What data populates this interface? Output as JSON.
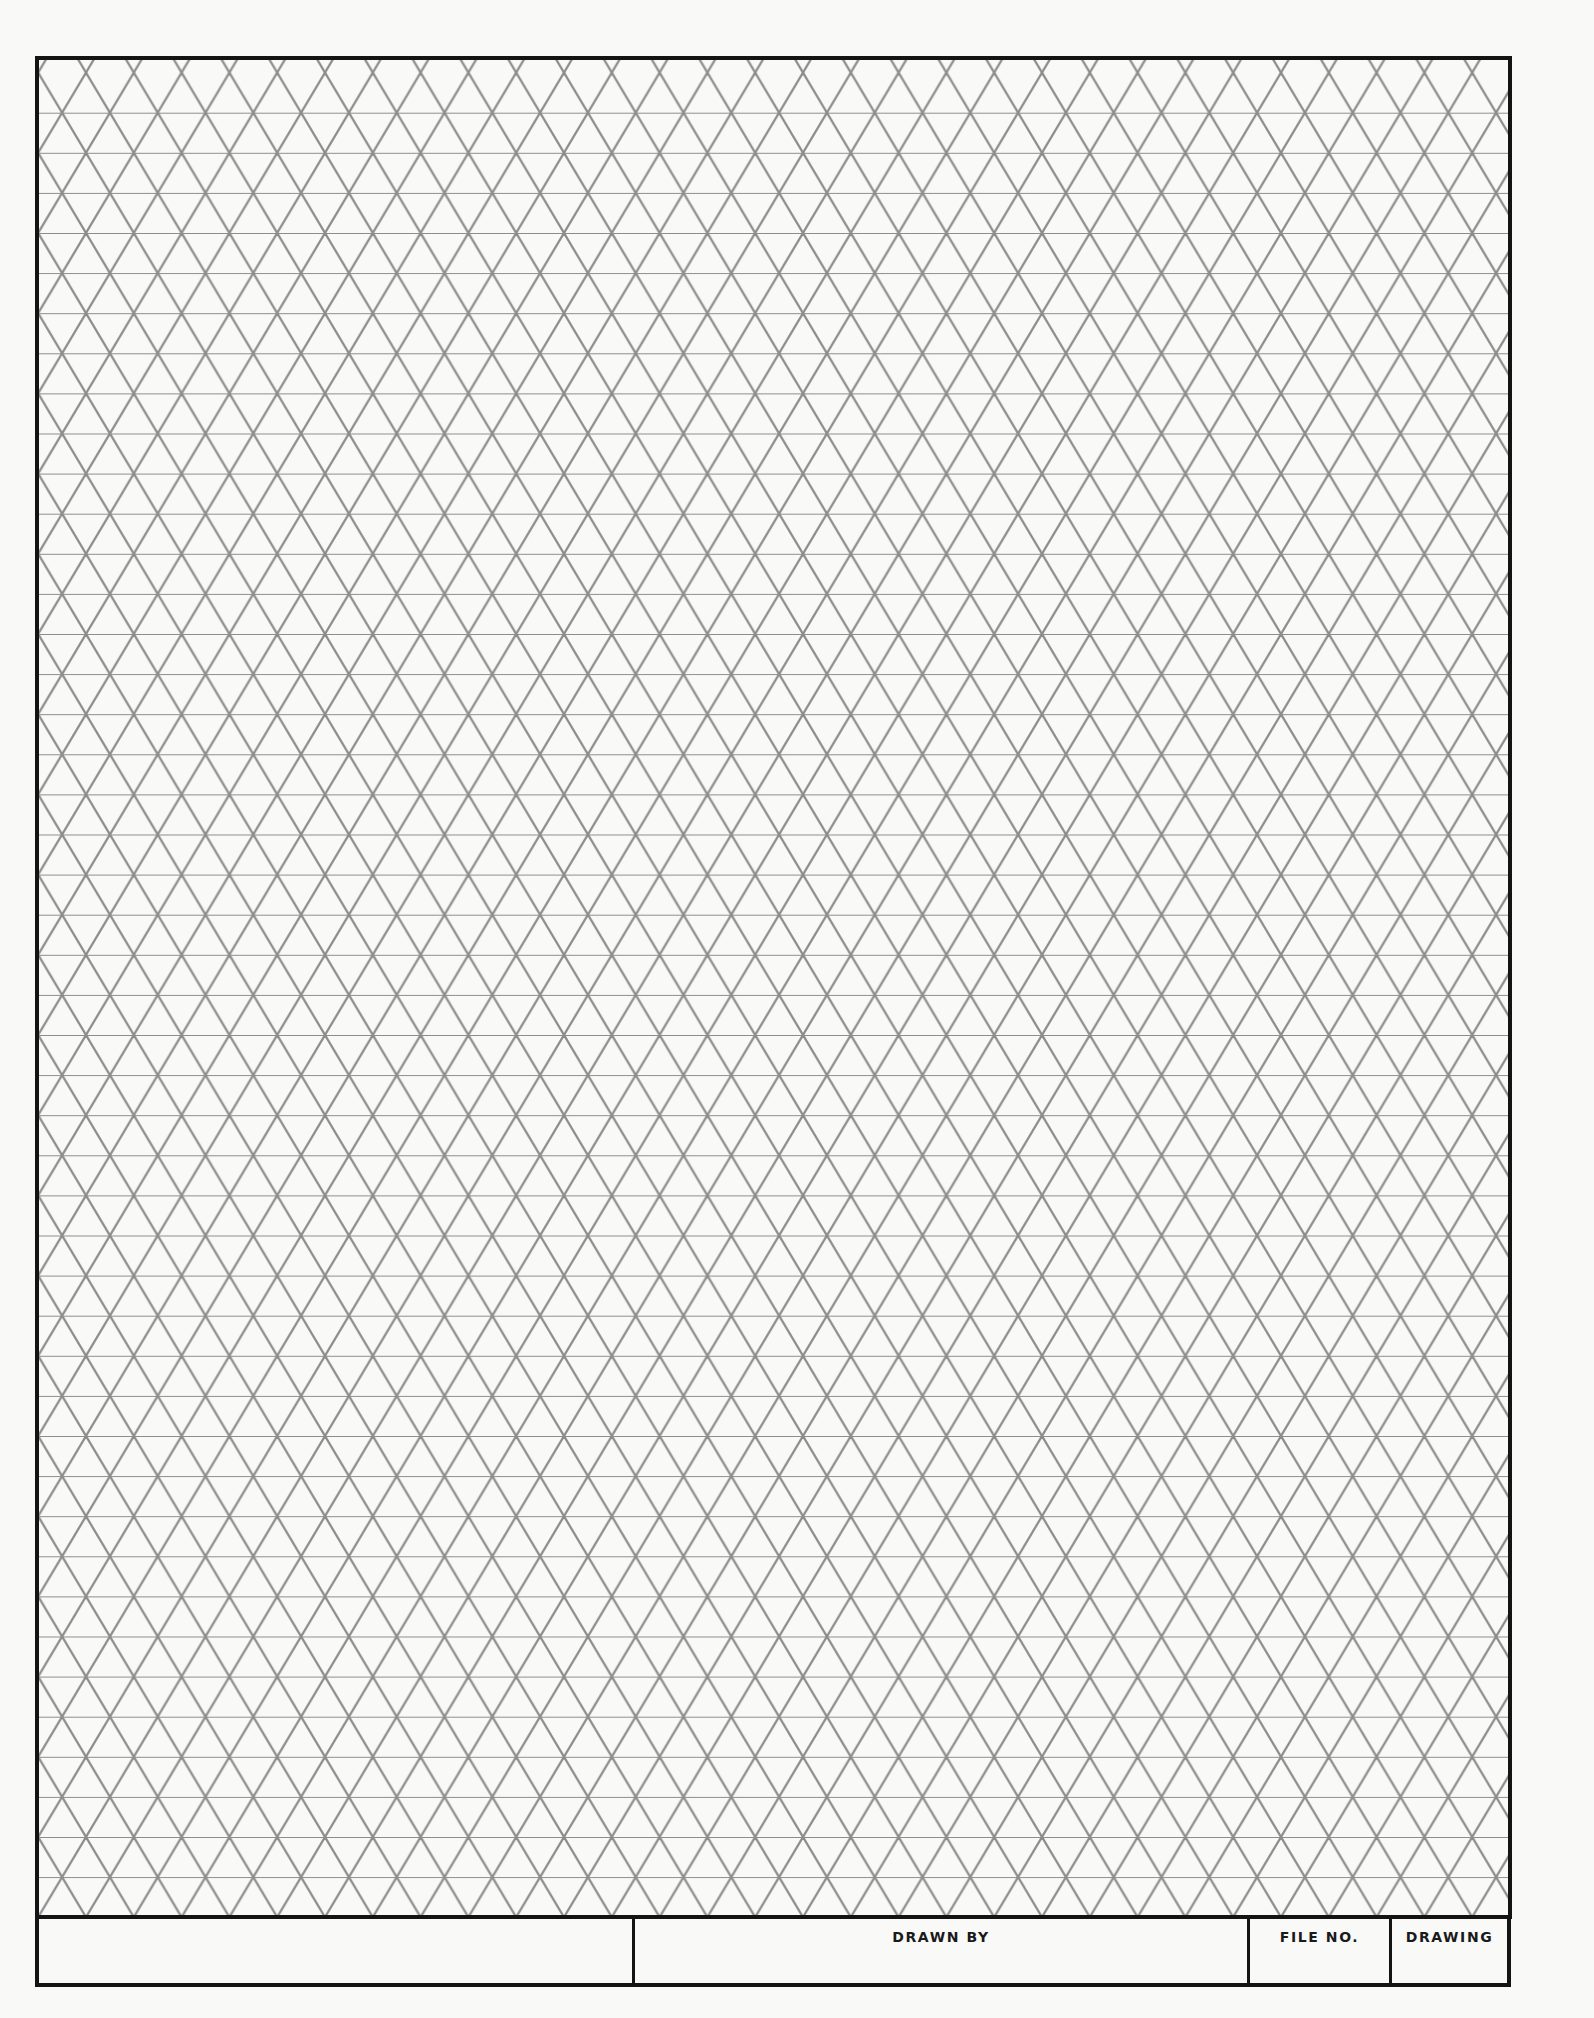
{
  "document": {
    "type": "isometric grid drawing sheet",
    "background_color": "#f9f9f8",
    "grid_line_color": "#8c8c8c",
    "border_color": "#141414",
    "grid": {
      "row_height_px": 40.1,
      "column_period_px": 47.8,
      "origin_x": 86,
      "origin_y": 72.6,
      "frame": {
        "left": 37,
        "top": 58,
        "right": 1510,
        "bottom": 1917
      }
    }
  },
  "title_block": {
    "cells": [
      {
        "id": "blank",
        "label": ""
      },
      {
        "id": "drawn_by",
        "label": "DRAWN BY",
        "value": ""
      },
      {
        "id": "file_no",
        "label": "FILE NO.",
        "value": ""
      },
      {
        "id": "drawing",
        "label": "DRAWING",
        "value": ""
      }
    ]
  }
}
